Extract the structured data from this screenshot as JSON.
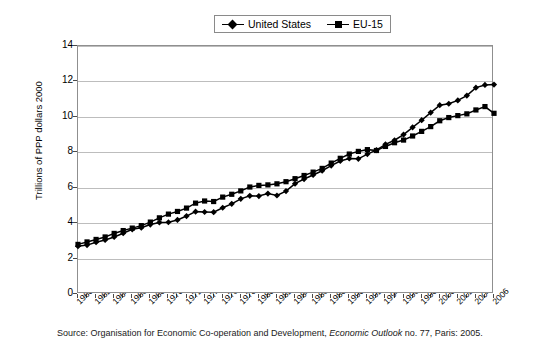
{
  "chart_data": {
    "type": "line",
    "title": "",
    "xlabel": "",
    "ylabel": "Trillions of PPP dollars 2000",
    "ylim": [
      0,
      14
    ],
    "ytick_step": 2,
    "yticks": [
      0,
      2,
      4,
      6,
      8,
      10,
      12,
      14
    ],
    "grid": true,
    "legend_position": "top-center",
    "xlim": [
      1960,
      2006
    ],
    "xtick_step": 2,
    "categories": [
      1960,
      1961,
      1962,
      1963,
      1964,
      1965,
      1966,
      1967,
      1968,
      1969,
      1970,
      1971,
      1972,
      1973,
      1974,
      1975,
      1976,
      1977,
      1978,
      1979,
      1980,
      1981,
      1982,
      1983,
      1984,
      1985,
      1986,
      1987,
      1988,
      1989,
      1990,
      1991,
      1992,
      1993,
      1994,
      1995,
      1996,
      1997,
      1998,
      1999,
      2000,
      2001,
      2002,
      2003,
      2004,
      2005,
      2006
    ],
    "xtick_labels": [
      "1960",
      "1962",
      "1964",
      "1966",
      "1968",
      "1970",
      "1972",
      "1974",
      "1976",
      "1978",
      "1980",
      "1982",
      "1984",
      "1986",
      "1988",
      "1990",
      "1992",
      "1994",
      "1996",
      "1998",
      "2000",
      "2002",
      "2004",
      "2006"
    ],
    "series": [
      {
        "name": "United States",
        "marker": "diamond",
        "color": "#000000",
        "values": [
          2.7,
          2.76,
          2.92,
          3.05,
          3.22,
          3.43,
          3.65,
          3.74,
          3.92,
          4.04,
          4.05,
          4.18,
          4.4,
          4.65,
          4.63,
          4.62,
          4.87,
          5.09,
          5.37,
          5.54,
          5.53,
          5.67,
          5.56,
          5.81,
          6.23,
          6.49,
          6.72,
          6.96,
          7.25,
          7.51,
          7.65,
          7.63,
          7.9,
          8.12,
          8.45,
          8.68,
          9.0,
          9.41,
          9.81,
          10.24,
          10.66,
          10.74,
          10.93,
          11.2,
          11.65,
          11.8,
          11.82
        ]
      },
      {
        "name": "EU-15",
        "marker": "square",
        "color": "#000000",
        "values": [
          2.8,
          2.94,
          3.08,
          3.22,
          3.42,
          3.58,
          3.72,
          3.86,
          4.06,
          4.3,
          4.51,
          4.66,
          4.85,
          5.13,
          5.25,
          5.22,
          5.47,
          5.63,
          5.82,
          6.04,
          6.13,
          6.16,
          6.22,
          6.34,
          6.51,
          6.69,
          6.88,
          7.09,
          7.39,
          7.66,
          7.9,
          8.05,
          8.15,
          8.1,
          8.33,
          8.54,
          8.69,
          8.92,
          9.18,
          9.45,
          9.78,
          9.96,
          10.07,
          10.17,
          10.39,
          10.58,
          10.2
        ]
      }
    ]
  },
  "legend": {
    "items": [
      {
        "label": "United States"
      },
      {
        "label": "EU-15"
      }
    ]
  },
  "source": {
    "prefix": "Source: Organisation for Economic Co-operation and Development, ",
    "italic": "Economic Outlook",
    "suffix": " no. 77, Paris: 2005."
  }
}
